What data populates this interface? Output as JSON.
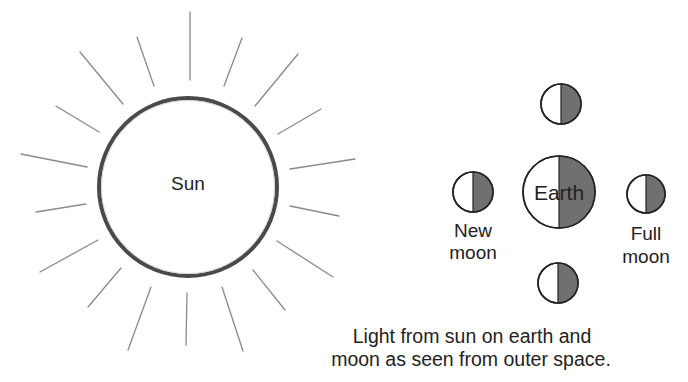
{
  "diagram": {
    "title_fragment": "g",
    "sun": {
      "label": "Sun",
      "center": [
        188,
        187
      ],
      "radius": 89,
      "rays": [
        [
          190,
          12,
          190,
          80
        ],
        [
          137,
          37,
          154,
          86
        ],
        [
          80,
          52,
          123,
          104
        ],
        [
          56,
          106,
          99,
          132
        ],
        [
          21,
          154,
          87,
          167
        ],
        [
          36,
          212,
          86,
          204
        ],
        [
          40,
          272,
          98,
          240
        ],
        [
          88,
          307,
          121,
          268
        ],
        [
          128,
          350,
          151,
          287
        ],
        [
          187,
          293,
          186,
          345
        ],
        [
          222,
          287,
          243,
          351
        ],
        [
          253,
          270,
          285,
          310
        ],
        [
          277,
          241,
          333,
          277
        ],
        [
          290,
          206,
          339,
          216
        ],
        [
          290,
          169,
          355,
          159
        ],
        [
          278,
          134,
          321,
          109
        ],
        [
          255,
          106,
          298,
          54
        ],
        [
          224,
          86,
          242,
          38
        ]
      ]
    },
    "earth": {
      "label": "Earth",
      "center": [
        559,
        192
      ],
      "radius": 36,
      "lit_side": "left",
      "shade_color": "#707070"
    },
    "moons": [
      {
        "id": "top",
        "center": [
          561,
          104
        ],
        "radius": 20,
        "label_lines": []
      },
      {
        "id": "new",
        "center": [
          473,
          192
        ],
        "radius": 20,
        "label_lines": [
          "New",
          "moon"
        ]
      },
      {
        "id": "full",
        "center": [
          646,
          194
        ],
        "radius": 19,
        "label_lines": [
          "Full",
          "moon"
        ]
      },
      {
        "id": "bottom",
        "center": [
          558,
          283
        ],
        "radius": 20,
        "label_lines": []
      }
    ],
    "labels": {
      "new_moon_line1": "New",
      "new_moon_line2": "moon",
      "full_moon_line1": "Full",
      "full_moon_line2": "moon"
    },
    "caption": {
      "line1": "Light from sun on earth and",
      "line2": "moon as seen from outer space."
    },
    "colors": {
      "shade": "#707070",
      "ray": "#8a8a8a",
      "sun_border": "#4a4a4a",
      "text": "#222222"
    }
  }
}
